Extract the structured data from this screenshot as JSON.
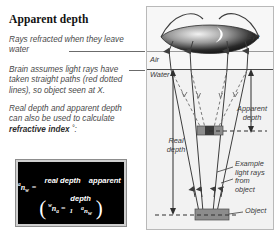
{
  "figure": {
    "title": "Apparent depth",
    "paragraphs": [
      "Rays refracted when they leave water",
      "Brain assumes light rays have taken straight paths (red dotted lines), so object seen at X.",
      "Real depth and apparent depth can also be used to calculate refractive index ˚:"
    ],
    "paragraph3_plain_a": "Real depth and apparent depth can also be used to calculate ",
    "paragraph3_bold": "refractive index",
    "paragraph3_plain_b": " ˚:"
  },
  "formula": {
    "lhs_pre": "a",
    "lhs_n": "n",
    "lhs_sub": "w",
    "equals": "=",
    "numerator": "real depth",
    "denominator": "apparent depth",
    "paren_open": "(",
    "paren_close": ")",
    "alt_pre": "w",
    "alt_n": "n",
    "alt_sub": "a",
    "alt_equals": "=",
    "alt_numerator": "1",
    "alt_den_pre": "a",
    "alt_den_n": "n",
    "alt_den_sub": "w"
  },
  "diagram": {
    "labels": {
      "air": "Air",
      "water": "Water",
      "eye": "Eye",
      "apparent_depth": "Apparent depth",
      "apparent_depth_line1": "Apparent",
      "apparent_depth_line2": "depth",
      "real_depth_line1": "Real",
      "real_depth_line2": "depth",
      "example_rays": "Example light rays from object",
      "example_line1": "Example",
      "example_line2": "light rays",
      "example_line3": "from",
      "example_line4": "object",
      "object": "Object",
      "image_marker": "X"
    },
    "colors": {
      "water_fill": "#f2f2f2",
      "air_fill": "#f7f7f7",
      "surface_line": "#4a4a4a",
      "ray_line": "#3d3d3d",
      "dotted_ray": "#7a7a7a",
      "block_fill": "#8c8c8c",
      "eye_dark": "#1c1c1c",
      "panel_border": "#b9b9b9"
    }
  }
}
